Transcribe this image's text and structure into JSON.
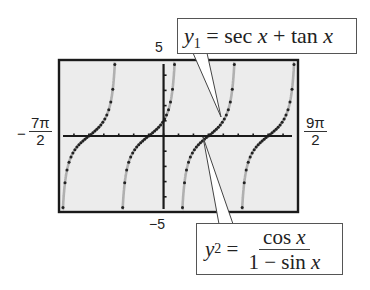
{
  "chart_data": {
    "type": "line",
    "title": "",
    "xlabel": "",
    "ylabel": "",
    "xlim_labels": [
      "-7π/2",
      "9π/2"
    ],
    "xlim": [
      -10.9956,
      14.1372
    ],
    "ylim": [
      -5,
      5
    ],
    "ylim_labels": [
      "-5",
      "5"
    ],
    "grid": false,
    "background": "#ececec",
    "series": [
      {
        "name": "y1 = sec x + tan x",
        "style": "solid gray curve",
        "color": "#b0b0b0",
        "asymptotes_x": [
          "-7π/2",
          "-3π/2",
          "π/2",
          "5π/2",
          "9π/2"
        ],
        "zeros_x": [
          "-5π/2",
          "-π/2",
          "3π/2",
          "7π/2"
        ]
      },
      {
        "name": "y2 = cos x / (1 - sin x)",
        "style": "dotted",
        "color": "#222222",
        "asymptotes_x": [
          "-7π/2",
          "-3π/2",
          "π/2",
          "5π/2",
          "9π/2"
        ],
        "zeros_x": [
          "-5π/2",
          "-π/2",
          "3π/2",
          "7π/2"
        ]
      }
    ],
    "annotations": [
      {
        "text": "y1 = sec x + tan x",
        "points_to": "branch near x = π/2"
      },
      {
        "text": "y2 = cos x / (1 − sin x)",
        "points_to": "zero crossing near x = 3π/2"
      }
    ]
  },
  "axes": {
    "ymax_label": "5",
    "ymin_label": "−5",
    "xmin": {
      "sign": "−",
      "num": "7π",
      "den": "2"
    },
    "xmax": {
      "num": "9π",
      "den": "2"
    }
  },
  "callouts": {
    "y1": {
      "var": "y",
      "sub": "1",
      "eq": " = sec ",
      "x1": "x",
      "plus": " + tan ",
      "x2": "x"
    },
    "y2": {
      "var": "y",
      "sub": "2",
      "eq": " =",
      "num_a": "cos ",
      "num_x": "x",
      "den_a": "1 − sin ",
      "den_x": "x"
    }
  }
}
